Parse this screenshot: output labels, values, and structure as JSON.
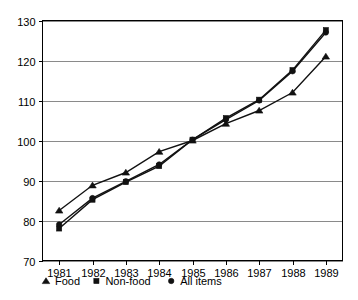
{
  "chart_data": {
    "type": "line",
    "title": "",
    "subtitle": "",
    "xlabel": "",
    "ylabel": "",
    "categories": [
      "1981",
      "1982",
      "1983",
      "1984",
      "1985",
      "1986",
      "1987",
      "1988",
      "1989"
    ],
    "x": [
      1981,
      1982,
      1983,
      1984,
      1985,
      1986,
      1987,
      1988,
      1989
    ],
    "xlim": [
      1980.6,
      1989.4
    ],
    "ylim": [
      70,
      130
    ],
    "yticks": [
      70,
      80,
      90,
      100,
      110,
      120,
      130
    ],
    "ytick_labels": [
      "70",
      "80",
      "90",
      "100",
      "110",
      "120",
      "130"
    ],
    "xtick_labels": [
      "1981",
      "1982",
      "1983",
      "1984",
      "1985",
      "1986",
      "1987",
      "1988",
      "1989"
    ],
    "grid": "horizontal",
    "legend_position": "below-plot-left",
    "series": [
      {
        "name": "Food",
        "marker": "triangle",
        "color": "#111111",
        "values": [
          82.5,
          88.8,
          92.0,
          97.2,
          100.0,
          104.2,
          107.5,
          112.0,
          121.0
        ]
      },
      {
        "name": "Non-food",
        "marker": "square",
        "color": "#111111",
        "values": [
          78.0,
          85.2,
          89.6,
          93.6,
          100.2,
          105.6,
          110.2,
          117.6,
          127.6
        ]
      },
      {
        "name": "All items",
        "marker": "circle",
        "color": "#111111",
        "values": [
          79.0,
          85.6,
          89.8,
          94.0,
          100.2,
          105.2,
          110.0,
          117.3,
          127.0
        ]
      }
    ],
    "legend": [
      {
        "marker": "triangle",
        "label": "Food"
      },
      {
        "marker": "square",
        "label": "Non-food"
      },
      {
        "marker": "circle",
        "label": "All items"
      }
    ]
  },
  "axes": {
    "y_tick_0": "70",
    "y_tick_1": "80",
    "y_tick_2": "90",
    "y_tick_3": "100",
    "y_tick_4": "110",
    "y_tick_5": "120",
    "y_tick_6": "130",
    "x_tick_0": "1981",
    "x_tick_1": "1982",
    "x_tick_2": "1983",
    "x_tick_3": "1984",
    "x_tick_4": "1985",
    "x_tick_5": "1986",
    "x_tick_6": "1987",
    "x_tick_7": "1988",
    "x_tick_8": "1989"
  },
  "legend": {
    "item_0_label": "Food",
    "item_1_label": "Non-food",
    "item_2_label": "All items"
  },
  "colors": {
    "ink": "#111111",
    "grid": "#8a8a8a",
    "frame": "#000000",
    "background": "#ffffff"
  }
}
